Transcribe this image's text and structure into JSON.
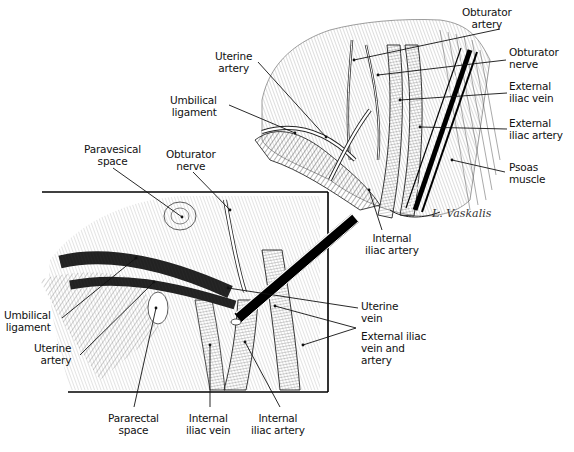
{
  "figure": {
    "type": "anatomical-illustration",
    "signature": "L. Vaskalis",
    "colors": {
      "ink": "#111111",
      "background": "#ffffff"
    }
  },
  "top_view": {
    "labels": [
      {
        "id": "obturator-artery",
        "lines": [
          "Obturator",
          "artery"
        ]
      },
      {
        "id": "obturator-nerve",
        "lines": [
          "Obturator",
          "nerve"
        ]
      },
      {
        "id": "uterine-artery",
        "lines": [
          "Uterine",
          "artery"
        ]
      },
      {
        "id": "umbilical-ligament",
        "lines": [
          "Umbilical",
          "ligament"
        ]
      },
      {
        "id": "external-iliac-vein",
        "lines": [
          "External",
          "iliac vein"
        ]
      },
      {
        "id": "external-iliac-artery",
        "lines": [
          "External",
          "iliac artery"
        ]
      },
      {
        "id": "psoas-muscle",
        "lines": [
          "Psoas",
          "muscle"
        ]
      },
      {
        "id": "internal-iliac-artery",
        "lines": [
          "Internal",
          "iliac artery"
        ]
      }
    ]
  },
  "inset_view": {
    "labels": [
      {
        "id": "paravesical-space",
        "lines": [
          "Paravesical",
          "space"
        ]
      },
      {
        "id": "obturator-nerve",
        "lines": [
          "Obturator",
          "nerve"
        ]
      },
      {
        "id": "umbilical-ligament",
        "lines": [
          "Umbilical",
          "ligament"
        ]
      },
      {
        "id": "uterine-artery",
        "lines": [
          "Uterine",
          "artery"
        ]
      },
      {
        "id": "uterine-vein",
        "lines": [
          "Uterine",
          "vein"
        ]
      },
      {
        "id": "external-iliac-vein-and-artery",
        "lines": [
          "External iliac",
          "vein and",
          "artery"
        ]
      },
      {
        "id": "pararectal-space",
        "lines": [
          "Pararectal",
          "space"
        ]
      },
      {
        "id": "internal-iliac-vein",
        "lines": [
          "Internal",
          "iliac vein"
        ]
      },
      {
        "id": "internal-iliac-artery",
        "lines": [
          "Internal",
          "iliac artery"
        ]
      }
    ]
  }
}
